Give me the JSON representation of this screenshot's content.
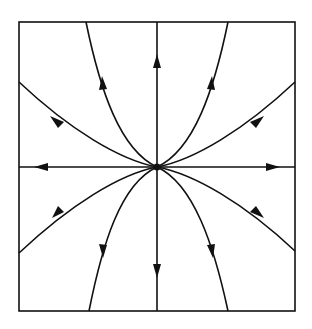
{
  "diagram": {
    "type": "phase-portrait",
    "stroke_color": "#111111",
    "background": "#ffffff",
    "box": {
      "x": 19,
      "y": 22,
      "width": 276,
      "height": 289
    },
    "equilibrium": {
      "x": 157,
      "y": 167
    },
    "trajectories": [
      {
        "name": "up",
        "direction": "outward"
      },
      {
        "name": "down",
        "direction": "outward"
      },
      {
        "name": "left",
        "direction": "outward"
      },
      {
        "name": "right",
        "direction": "outward"
      },
      {
        "name": "upper-left-steep",
        "direction": "outward"
      },
      {
        "name": "upper-right-steep",
        "direction": "outward"
      },
      {
        "name": "lower-left-steep",
        "direction": "outward"
      },
      {
        "name": "lower-right-steep",
        "direction": "outward"
      },
      {
        "name": "upper-left-shallow",
        "direction": "outward"
      },
      {
        "name": "upper-right-shallow",
        "direction": "outward"
      },
      {
        "name": "lower-left-shallow",
        "direction": "outward"
      },
      {
        "name": "lower-right-shallow",
        "direction": "outward"
      }
    ]
  }
}
